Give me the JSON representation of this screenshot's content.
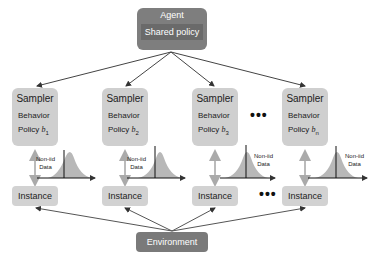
{
  "agent": {
    "title": "Agent",
    "inner": "Shared policy"
  },
  "samplers": [
    {
      "title": "Sampler",
      "line1": "Behavior",
      "line2": "Policy",
      "symbol": "b",
      "sub": "1"
    },
    {
      "title": "Sampler",
      "line1": "Behavior",
      "line2": "Policy",
      "symbol": "b",
      "sub": "2"
    },
    {
      "title": "Sampler",
      "line1": "Behavior",
      "line2": "Policy",
      "symbol": "b",
      "sub": "3"
    },
    {
      "title": "Sampler",
      "line1": "Behavior",
      "line2": "Policy",
      "symbol": "b",
      "sub": "n"
    }
  ],
  "data_labels": [
    {
      "line1": "Non-iid",
      "line2": "Data"
    },
    {
      "line1": "Non-iid",
      "line2": "Data"
    },
    {
      "line1": "Non-iid",
      "line2": "Data"
    },
    {
      "line1": "Non-iid",
      "line2": "Data"
    }
  ],
  "instances": [
    "Instance",
    "Instance",
    "Instance",
    "Instance"
  ],
  "ellipsis": "•••",
  "environment": "Environment",
  "colors": {
    "dark_box": "#7e7e7e",
    "light_box": "#cfcfcf",
    "arrow": "#444444",
    "vertical_arrow": "#bbbbbb",
    "dist_fill": "#b8b8b8"
  }
}
